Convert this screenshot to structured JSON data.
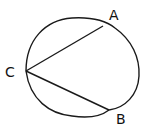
{
  "diagram": {
    "type": "circle-with-chords",
    "stroke_color": "#1a1a1a",
    "background": "#ffffff",
    "circle": {
      "cx": 82,
      "cy": 68,
      "rx": 57,
      "ry": 52
    },
    "points": {
      "A": {
        "label": "A",
        "x": 103,
        "y": 26,
        "label_x": 109,
        "label_y": 20
      },
      "B": {
        "label": "B",
        "x": 109,
        "y": 110,
        "label_x": 116,
        "label_y": 124
      },
      "C": {
        "label": "C",
        "x": 26,
        "y": 71,
        "label_x": 5,
        "label_y": 77
      }
    },
    "chords": [
      {
        "from": "C",
        "to": "A"
      },
      {
        "from": "C",
        "to": "B"
      }
    ]
  }
}
